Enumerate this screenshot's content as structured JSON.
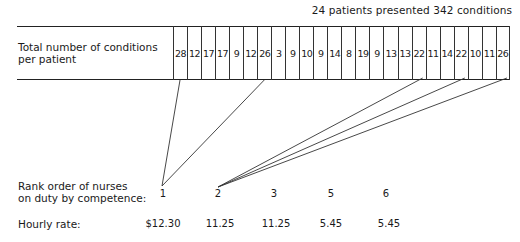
{
  "caption": "24 patients presented 342 conditions",
  "table": {
    "row_label_line1": "Total number of conditions",
    "row_label_line2": "per patient",
    "conditions": [
      28,
      12,
      17,
      17,
      9,
      12,
      26,
      3,
      9,
      10,
      9,
      14,
      8,
      19,
      9,
      13,
      13,
      22,
      11,
      14,
      22,
      10,
      11,
      26
    ]
  },
  "nurses": {
    "rank_label_line1": "Rank order of nurses",
    "rank_label_line2": "on duty by competence:",
    "rate_label": "Hourly rate:",
    "ranks": [
      "1",
      "2",
      "3",
      "5",
      "6"
    ],
    "rates": [
      "$12.30",
      "11.25",
      "11.25",
      "5.45",
      "5.45"
    ]
  },
  "links": [
    {
      "rank": "1",
      "patient_columns": [
        1,
        7
      ]
    },
    {
      "rank": "2",
      "patient_columns": [
        18,
        21,
        24
      ]
    }
  ]
}
